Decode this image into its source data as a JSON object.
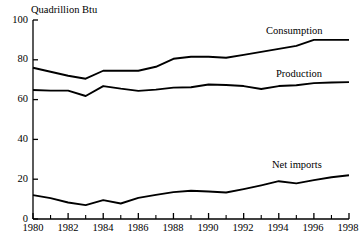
{
  "chart_data": {
    "type": "line",
    "title": "",
    "xlabel": "",
    "ylabel": "Quadrillion Btu",
    "xlim": [
      1980,
      1998
    ],
    "ylim": [
      0,
      100
    ],
    "yticks": [
      0,
      20,
      40,
      60,
      80,
      100
    ],
    "xticks_major": [
      1980,
      1982,
      1984,
      1986,
      1988,
      1990,
      1992,
      1994,
      1996,
      1998
    ],
    "xticks_minor": [
      1981,
      1983,
      1985,
      1987,
      1989,
      1991,
      1993,
      1995,
      1997
    ],
    "grid": false,
    "legend_position": "inline-labels",
    "line_color": "#000000",
    "x": [
      1980,
      1981,
      1982,
      1983,
      1984,
      1985,
      1986,
      1987,
      1988,
      1989,
      1990,
      1991,
      1992,
      1993,
      1994,
      1995,
      1996,
      1997,
      1998
    ],
    "series": [
      {
        "name": "Consumption",
        "values": [
          76,
          74,
          72,
          70.5,
          74.5,
          74.5,
          74.5,
          76.5,
          80.5,
          81.5,
          81.5,
          81,
          82.5,
          84,
          85.5,
          87,
          90,
          90,
          90
        ]
      },
      {
        "name": "Production",
        "values": [
          64.8,
          64.5,
          64.5,
          61.8,
          66.8,
          65.5,
          64.4,
          65,
          66,
          66.2,
          67.6,
          67.3,
          66.8,
          65.3,
          66.8,
          67.2,
          68.3,
          68.6,
          68.8
        ]
      },
      {
        "name": "Net imports",
        "values": [
          12,
          10.5,
          8.3,
          7,
          9.5,
          7.8,
          10.6,
          12.1,
          13.5,
          14.2,
          13.8,
          13.3,
          15,
          16.9,
          19,
          17.9,
          19.5,
          21,
          22
        ]
      }
    ],
    "annotations": [
      {
        "text": "Consumption",
        "x": 1996,
        "y": 95
      },
      {
        "text": "Production",
        "x": 1996,
        "y": 74
      },
      {
        "text": "Net imports",
        "x": 1995,
        "y": 28
      }
    ]
  },
  "axis": {
    "y_title": "Quadrillion Btu",
    "y_labels": [
      "100",
      "80",
      "60",
      "40",
      "20",
      "0"
    ],
    "x_labels": [
      "1980",
      "1982",
      "1984",
      "1986",
      "1988",
      "1990",
      "1992",
      "1994",
      "1996",
      "1998"
    ]
  },
  "labels": {
    "consumption": "Consumption",
    "production": "Production",
    "net_imports": "Net imports"
  }
}
